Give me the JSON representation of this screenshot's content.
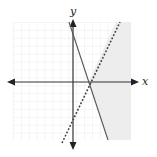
{
  "graph": {
    "type": "system-of-linear-inequalities",
    "axis_labels": {
      "x": "x",
      "y": "y"
    },
    "colors": {
      "grid": "#e6e6e6",
      "axis": "#333333",
      "solid_line": "#555555",
      "dashed_line": "#444444",
      "shading": "#ebebeb"
    },
    "lines": [
      {
        "name": "solid-boundary",
        "style": "solid",
        "x1": 69,
        "y1": 22,
        "x2": 108,
        "y2": 140
      },
      {
        "name": "dashed-boundary",
        "style": "dashed",
        "x1": 62,
        "y1": 143,
        "x2": 120,
        "y2": 22
      }
    ],
    "shaded_region": "right of both boundary lines"
  }
}
